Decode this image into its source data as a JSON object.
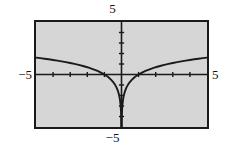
{
  "figure": {
    "name": "calculator-graph",
    "background_color": "#ffffff",
    "plot_fill_color": "#d6d6d6",
    "frame_color": "#1a1a1a",
    "curve_color": "#1a1a1a",
    "axis_color": "#1a1a1a"
  },
  "labels": {
    "ymax": "5",
    "ymin": "−5",
    "xmin": "−5",
    "xmax": "5"
  },
  "chart_data": {
    "type": "line",
    "title": "",
    "subtitle": "",
    "xlabel": "",
    "ylabel": "",
    "xlim": [
      -5,
      5
    ],
    "ylim": [
      -5,
      5
    ],
    "grid": false,
    "legend": "none",
    "x_tick_interval": 1,
    "y_tick_interval": 1,
    "x_ticks": [
      -4,
      -3,
      -2,
      -1,
      1,
      2,
      3,
      4
    ],
    "y_ticks": [
      -4,
      -3,
      -2,
      -1,
      1,
      2,
      3,
      4
    ],
    "axes_shown": [
      "x-axis",
      "y-axis"
    ],
    "function": "y = ln|x|",
    "annotations": [],
    "series": [
      {
        "name": "y = ln|x| (x < 0)",
        "points": [
          [
            -5.0,
            1.609
          ],
          [
            -4.75,
            1.558
          ],
          [
            -4.5,
            1.504
          ],
          [
            -4.25,
            1.447
          ],
          [
            -4.0,
            1.386
          ],
          [
            -3.75,
            1.322
          ],
          [
            -3.5,
            1.253
          ],
          [
            -3.25,
            1.179
          ],
          [
            -3.0,
            1.099
          ],
          [
            -2.75,
            1.012
          ],
          [
            -2.5,
            0.916
          ],
          [
            -2.25,
            0.811
          ],
          [
            -2.0,
            0.693
          ],
          [
            -1.8,
            0.588
          ],
          [
            -1.6,
            0.47
          ],
          [
            -1.4,
            0.336
          ],
          [
            -1.2,
            0.182
          ],
          [
            -1.0,
            0.0
          ],
          [
            -0.9,
            -0.105
          ],
          [
            -0.8,
            -0.223
          ],
          [
            -0.7,
            -0.357
          ],
          [
            -0.6,
            -0.511
          ],
          [
            -0.5,
            -0.693
          ],
          [
            -0.4,
            -0.916
          ],
          [
            -0.3,
            -1.204
          ],
          [
            -0.25,
            -1.386
          ],
          [
            -0.2,
            -1.609
          ],
          [
            -0.15,
            -1.897
          ],
          [
            -0.12,
            -2.12
          ],
          [
            -0.1,
            -2.303
          ],
          [
            -0.08,
            -2.526
          ],
          [
            -0.06,
            -2.813
          ],
          [
            -0.045,
            -3.101
          ],
          [
            -0.035,
            -3.352
          ],
          [
            -0.027,
            -3.612
          ],
          [
            -0.02,
            -3.912
          ],
          [
            -0.015,
            -4.2
          ],
          [
            -0.011,
            -4.51
          ],
          [
            -0.0085,
            -4.768
          ],
          [
            -0.0067,
            -5.0
          ]
        ]
      },
      {
        "name": "y = ln|x| (x > 0)",
        "points": [
          [
            0.0067,
            -5.0
          ],
          [
            0.0085,
            -4.768
          ],
          [
            0.011,
            -4.51
          ],
          [
            0.015,
            -4.2
          ],
          [
            0.02,
            -3.912
          ],
          [
            0.027,
            -3.612
          ],
          [
            0.035,
            -3.352
          ],
          [
            0.045,
            -3.101
          ],
          [
            0.06,
            -2.813
          ],
          [
            0.08,
            -2.526
          ],
          [
            0.1,
            -2.303
          ],
          [
            0.12,
            -2.12
          ],
          [
            0.15,
            -1.897
          ],
          [
            0.2,
            -1.609
          ],
          [
            0.25,
            -1.386
          ],
          [
            0.3,
            -1.204
          ],
          [
            0.4,
            -0.916
          ],
          [
            0.5,
            -0.693
          ],
          [
            0.6,
            -0.511
          ],
          [
            0.7,
            -0.357
          ],
          [
            0.8,
            -0.223
          ],
          [
            0.9,
            -0.105
          ],
          [
            1.0,
            0.0
          ],
          [
            1.2,
            0.182
          ],
          [
            1.4,
            0.336
          ],
          [
            1.6,
            0.47
          ],
          [
            1.8,
            0.588
          ],
          [
            2.0,
            0.693
          ],
          [
            2.25,
            0.811
          ],
          [
            2.5,
            0.916
          ],
          [
            2.75,
            1.012
          ],
          [
            3.0,
            1.099
          ],
          [
            3.25,
            1.179
          ],
          [
            3.5,
            1.253
          ],
          [
            3.75,
            1.322
          ],
          [
            4.0,
            1.386
          ],
          [
            4.25,
            1.447
          ],
          [
            4.5,
            1.504
          ],
          [
            4.75,
            1.558
          ],
          [
            5.0,
            1.609
          ]
        ]
      }
    ]
  }
}
